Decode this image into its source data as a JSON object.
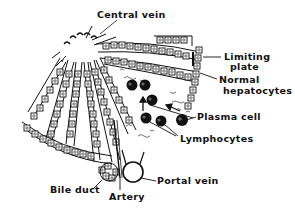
{
  "diagram": {
    "type": "histology-schematic",
    "ink_color": "#111111",
    "background": "#ffffff",
    "labels": {
      "central_vein": "Central vein",
      "limiting_plate_line1": "Limiting",
      "limiting_plate_line2": "plate",
      "normal_hepatocytes_line1": "Normal",
      "normal_hepatocytes_line2": "hepatocytes",
      "plasma_cell": "Plasma cell",
      "lymphocytes": "Lymphocytes",
      "bile_duct": "Bile duct",
      "artery": "Artery",
      "portal_vein": "Portal vein"
    },
    "structures": [
      {
        "name": "central-vein",
        "shape": "circle-with-sinusoid-openings"
      },
      {
        "name": "hepatocyte-plates",
        "shape": "radiating-cell-cords",
        "count": 6
      },
      {
        "name": "limiting-plate",
        "shape": "vertical-cell-column"
      },
      {
        "name": "plasma-cell",
        "shape": "dark-circle"
      },
      {
        "name": "lymphocytes",
        "shape": "dark-circles",
        "count": 5
      },
      {
        "name": "migration-arrows",
        "count": 2
      },
      {
        "name": "bile-duct",
        "shape": "ring-of-cuboidal-cells"
      },
      {
        "name": "artery",
        "shape": "thin-vessel"
      },
      {
        "name": "portal-vein",
        "shape": "open-circle"
      }
    ]
  }
}
